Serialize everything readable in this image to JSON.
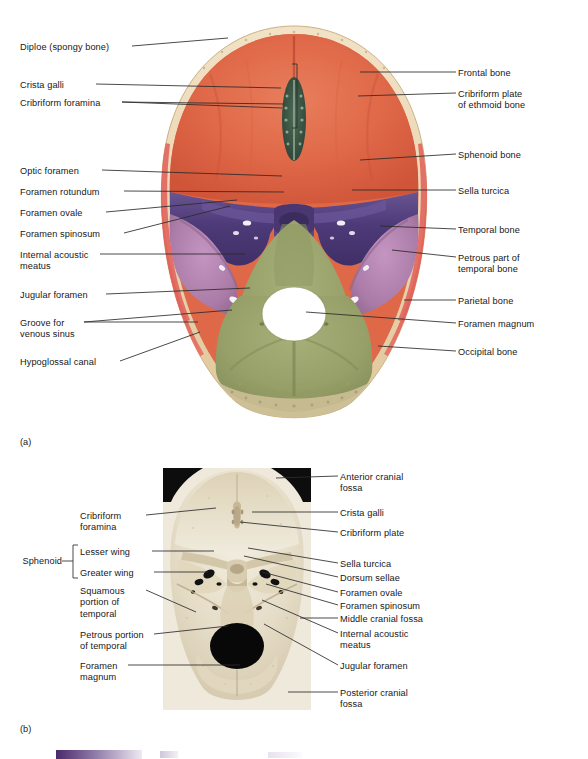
{
  "figure": {
    "panel_a_caption": "(a)",
    "panel_b_caption": "(b)"
  },
  "panel_a": {
    "type": "illustration",
    "description": "Superior view of the floor of the cranial cavity",
    "labels_left": [
      {
        "text": "Diploe (spongy bone)",
        "x": 20,
        "y": 42
      },
      {
        "text": "Crista galli",
        "x": 20,
        "y": 80
      },
      {
        "text": "Cribriform foramina",
        "x": 20,
        "y": 98
      },
      {
        "text": "Optic foramen",
        "x": 20,
        "y": 166
      },
      {
        "text": "Foramen rotundum",
        "x": 20,
        "y": 187
      },
      {
        "text": "Foramen ovale",
        "x": 20,
        "y": 208
      },
      {
        "text": "Foramen spinosum",
        "x": 20,
        "y": 229
      },
      {
        "text": "Internal acoustic\nmeatus",
        "x": 20,
        "y": 250
      },
      {
        "text": "Jugular foramen",
        "x": 20,
        "y": 290
      },
      {
        "text": "Groove for\nvenous sinus",
        "x": 20,
        "y": 318
      },
      {
        "text": "Hypoglossal canal",
        "x": 20,
        "y": 357
      }
    ],
    "labels_right": [
      {
        "text": "Frontal bone",
        "x": 458,
        "y": 68
      },
      {
        "text": "Cribriform plate\nof ethmoid bone",
        "x": 458,
        "y": 89
      },
      {
        "text": "Sphenoid bone",
        "x": 458,
        "y": 150
      },
      {
        "text": "Sella turcica",
        "x": 458,
        "y": 186
      },
      {
        "text": "Temporal bone",
        "x": 458,
        "y": 225
      },
      {
        "text": "Petrous part of\ntemporal bone",
        "x": 458,
        "y": 253
      },
      {
        "text": "Parietal bone",
        "x": 458,
        "y": 296
      },
      {
        "text": "Foramen magnum",
        "x": 458,
        "y": 319
      },
      {
        "text": "Occipital bone",
        "x": 458,
        "y": 347
      }
    ],
    "colors": {
      "frontal_fossa": "#e06a4a",
      "diploe_rim": "#ecd9b8",
      "sphenoid": "#55417f",
      "sphenoid_light": "#7f6aa3",
      "temporal": "#b887b4",
      "occipital": "#9aa36a",
      "parietal_rim": "#e2655d",
      "crista_galli": "#3d5a4a",
      "foramen_magnum": "#ffffff"
    }
  },
  "panel_b": {
    "type": "photograph",
    "description": "Photograph of the cranial floor of a real skull",
    "group_label": "Sphenoid",
    "labels_left": [
      {
        "text": "Cribriform\nforamina",
        "x": 80,
        "y": 511
      },
      {
        "text": "Lesser wing",
        "x": 80,
        "y": 547
      },
      {
        "text": "Greater wing",
        "x": 80,
        "y": 568
      },
      {
        "text": "Squamous\nportion of\ntemporal",
        "x": 80,
        "y": 586
      },
      {
        "text": "Petrous portion\nof temporal",
        "x": 80,
        "y": 630
      },
      {
        "text": "Foramen\nmagnum",
        "x": 80,
        "y": 661
      }
    ],
    "labels_right": [
      {
        "text": "Anterior cranial\nfossa",
        "x": 340,
        "y": 472
      },
      {
        "text": "Crista galli",
        "x": 340,
        "y": 508
      },
      {
        "text": "Cribriform plate",
        "x": 340,
        "y": 528
      },
      {
        "text": "Sella turcica",
        "x": 340,
        "y": 559
      },
      {
        "text": "Dorsum sellae",
        "x": 340,
        "y": 573
      },
      {
        "text": "Foramen ovale",
        "x": 340,
        "y": 588
      },
      {
        "text": "Foramen spinosum",
        "x": 340,
        "y": 601
      },
      {
        "text": "Middle cranial fossa",
        "x": 340,
        "y": 614
      },
      {
        "text": "Internal acoustic\nmeatus",
        "x": 340,
        "y": 629
      },
      {
        "text": "Jugular foramen",
        "x": 340,
        "y": 661
      },
      {
        "text": "Posterior cranial\nfossa",
        "x": 340,
        "y": 688
      }
    ],
    "colors": {
      "bone": "#e6dfcd",
      "bone_shadow": "#c9bfa6",
      "background": "#000000",
      "foramen": "#0a0a0a"
    }
  }
}
